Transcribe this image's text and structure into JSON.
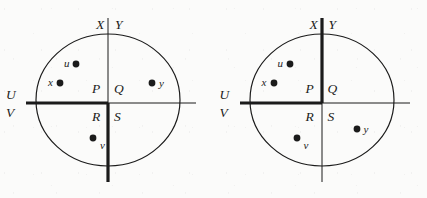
{
  "meta": {
    "caption": "Two partitioned-disc diagrams showing regions P, Q, R, S and points u, x, v, y",
    "background_color": "#fbfbfa",
    "ink_color": "#1b1b1b"
  },
  "figures": [
    {
      "name": "left-figure",
      "ellipse": {
        "cx": 108,
        "cy": 100,
        "rx": 72,
        "ry": 66
      },
      "axes": {
        "vertical": {
          "x": 108,
          "y_top": 18,
          "y_bottom": 182,
          "bold_half": "bottom"
        },
        "horizontal": {
          "y": 103,
          "x_left": 26,
          "x_right": 196,
          "bold_half": "left"
        }
      },
      "axis_labels": [
        {
          "text": "X",
          "name": "axis-label-x",
          "x": 96,
          "y": 18
        },
        {
          "text": "Y",
          "name": "axis-label-y",
          "x": 115,
          "y": 18
        },
        {
          "text": "U",
          "name": "axis-label-u",
          "x": 6,
          "y": 88
        },
        {
          "text": "V",
          "name": "axis-label-v",
          "x": 6,
          "y": 106
        }
      ],
      "regions": [
        {
          "text": "P",
          "name": "region-label-p",
          "x": 92,
          "y": 82
        },
        {
          "text": "Q",
          "name": "region-label-q",
          "x": 114,
          "y": 82
        },
        {
          "text": "R",
          "name": "region-label-r",
          "x": 92,
          "y": 110
        },
        {
          "text": "S",
          "name": "region-label-s",
          "x": 114,
          "y": 110
        }
      ],
      "points": [
        {
          "id": "u",
          "name": "point-u",
          "cx": 76,
          "cy": 64,
          "label_x": 64,
          "label_y": 58,
          "label_side": "left"
        },
        {
          "id": "x",
          "name": "point-x",
          "cx": 60,
          "cy": 83,
          "label_x": 48,
          "label_y": 77,
          "label_side": "left"
        },
        {
          "id": "y",
          "name": "point-y",
          "cx": 152,
          "cy": 83,
          "label_x": 159,
          "label_y": 78,
          "label_side": "right"
        },
        {
          "id": "v",
          "name": "point-v",
          "cx": 93,
          "cy": 138,
          "label_x": 100,
          "label_y": 140,
          "label_side": "right"
        }
      ]
    },
    {
      "name": "right-figure",
      "ellipse": {
        "cx": 108,
        "cy": 100,
        "rx": 72,
        "ry": 66
      },
      "axes": {
        "vertical": {
          "x": 108,
          "y_top": 18,
          "y_bottom": 182,
          "bold_half": "top"
        },
        "horizontal": {
          "y": 103,
          "x_left": 26,
          "x_right": 196,
          "bold_half": "left"
        }
      },
      "axis_labels": [
        {
          "text": "X",
          "name": "axis-label-x",
          "x": 96,
          "y": 18
        },
        {
          "text": "Y",
          "name": "axis-label-y",
          "x": 115,
          "y": 18
        },
        {
          "text": "U",
          "name": "axis-label-u",
          "x": 6,
          "y": 88
        },
        {
          "text": "V",
          "name": "axis-label-v",
          "x": 6,
          "y": 106
        }
      ],
      "regions": [
        {
          "text": "P",
          "name": "region-label-p",
          "x": 92,
          "y": 82
        },
        {
          "text": "Q",
          "name": "region-label-q",
          "x": 114,
          "y": 82
        },
        {
          "text": "R",
          "name": "region-label-r",
          "x": 92,
          "y": 110
        },
        {
          "text": "S",
          "name": "region-label-s",
          "x": 114,
          "y": 110
        }
      ],
      "points": [
        {
          "id": "u",
          "name": "point-u",
          "cx": 76,
          "cy": 64,
          "label_x": 64,
          "label_y": 58,
          "label_side": "left"
        },
        {
          "id": "x",
          "name": "point-x",
          "cx": 60,
          "cy": 83,
          "label_x": 48,
          "label_y": 77,
          "label_side": "left"
        },
        {
          "id": "v",
          "name": "point-v",
          "cx": 83,
          "cy": 138,
          "label_x": 90,
          "label_y": 140,
          "label_side": "right"
        },
        {
          "id": "y",
          "name": "point-y",
          "cx": 143,
          "cy": 129,
          "label_x": 150,
          "label_y": 124,
          "label_side": "right"
        }
      ]
    }
  ],
  "style": {
    "ellipse_stroke_width": 1.2,
    "thin_stroke_width": 1.0,
    "bold_stroke_width": 3.2,
    "point_radius": 3.4
  }
}
